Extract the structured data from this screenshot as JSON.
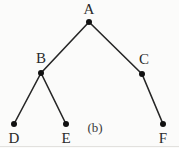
{
  "figure": {
    "caption": "(b)",
    "caption_position": {
      "x": 95,
      "y": 127
    },
    "background_color": "#fbfbfa",
    "stroke_color": "#262626",
    "node_color": "#111111",
    "label_color": "#2a2a2a"
  },
  "chart_data": {
    "type": "diagram",
    "diagram_kind": "tree",
    "title": "(b)",
    "nodes": [
      {
        "id": "A",
        "label": "A",
        "x": 89,
        "y": 22,
        "label_x": 89,
        "label_y": 9
      },
      {
        "id": "B",
        "label": "B",
        "x": 41,
        "y": 73,
        "label_x": 41,
        "label_y": 58
      },
      {
        "id": "C",
        "label": "C",
        "x": 142,
        "y": 74,
        "label_x": 144,
        "label_y": 59
      },
      {
        "id": "D",
        "label": "D",
        "x": 14,
        "y": 124,
        "label_x": 14,
        "label_y": 138
      },
      {
        "id": "E",
        "label": "E",
        "x": 66,
        "y": 124,
        "label_x": 66,
        "label_y": 138
      },
      {
        "id": "F",
        "label": "F",
        "x": 163,
        "y": 124,
        "label_x": 163,
        "label_y": 138
      }
    ],
    "edges": [
      {
        "from": "A",
        "to": "B"
      },
      {
        "from": "A",
        "to": "C"
      },
      {
        "from": "B",
        "to": "D"
      },
      {
        "from": "B",
        "to": "E"
      },
      {
        "from": "C",
        "to": "F"
      }
    ],
    "node_radius": 3,
    "edge_width": 1.6,
    "legend": [],
    "grid": false
  }
}
